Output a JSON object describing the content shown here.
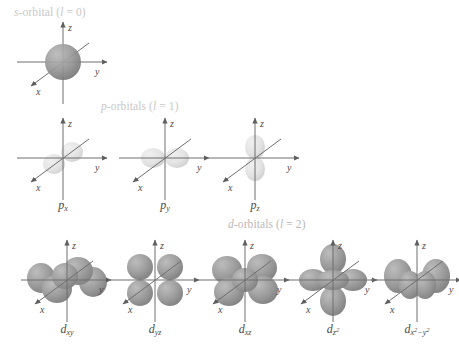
{
  "figure": {
    "background": "#ffffff",
    "axis_color": "#6e6e6e",
    "label_color": "#4a4a4a",
    "header_color": "#c8c8c8",
    "lobe_color": "#8c8c8c",
    "lobe_color_light": "#d8d8d8"
  },
  "sections": [
    {
      "id": "s",
      "header": "s-orbital (l = 0)",
      "header_prefix": "s",
      "header_rest": "-orbital (",
      "header_l": "l",
      "header_tail": " = 0)",
      "x": 14,
      "y": 6,
      "orbitals": [
        {
          "label": "",
          "label_base": "",
          "sub": "",
          "cx": 63,
          "cy": 62,
          "kind": "s"
        }
      ]
    },
    {
      "id": "p",
      "header": "p-orbitals (l = 1)",
      "header_prefix": "p",
      "header_rest": "-orbitals (",
      "header_l": "l",
      "header_tail": " = 1)",
      "x": 101,
      "y": 100,
      "orbitals": [
        {
          "label": "px",
          "label_base": "p",
          "sub": "x",
          "cx": 63,
          "cy": 158,
          "kind": "px"
        },
        {
          "label": "py",
          "label_base": "p",
          "sub": "y",
          "cx": 165,
          "cy": 158,
          "kind": "py"
        },
        {
          "label": "pz",
          "label_base": "p",
          "sub": "z",
          "cx": 255,
          "cy": 158,
          "kind": "pz"
        }
      ]
    },
    {
      "id": "d",
      "header": "d-orbitals (l = 2)",
      "header_prefix": "d",
      "header_rest": "-orbitals (",
      "header_l": "l",
      "header_tail": " = 2)",
      "x": 228,
      "y": 218,
      "orbitals": [
        {
          "label": "dxy",
          "label_base": "d",
          "sub": "xy",
          "cx": 67,
          "cy": 280,
          "kind": "dxy"
        },
        {
          "label": "dyz",
          "label_base": "d",
          "sub": "yz",
          "cx": 155,
          "cy": 280,
          "kind": "dyz"
        },
        {
          "label": "dxz",
          "label_base": "d",
          "sub": "xz",
          "cx": 245,
          "cy": 280,
          "kind": "dxz"
        },
        {
          "label": "dz2",
          "label_base": "d",
          "sub": "z",
          "sup": "2",
          "cx": 333,
          "cy": 280,
          "kind": "dz2"
        },
        {
          "label": "dx2-y2",
          "label_base": "d",
          "sub": "x",
          "sup": "2",
          "sub2": "−y",
          "sup2": "2",
          "cx": 417,
          "cy": 280,
          "kind": "dx2y2"
        }
      ]
    }
  ],
  "axes": {
    "z_label": "z",
    "y_label": "y",
    "x_label": "x"
  },
  "labels": {
    "s_orbital_caption": "",
    "p_x": "p",
    "p_y": "p",
    "p_z": "p",
    "d_xy": "d",
    "d_yz": "d",
    "d_xz": "d",
    "d_z2": "d",
    "d_x2y2": "d",
    "sub_px": "x",
    "sub_py": "y",
    "sub_pz": "z",
    "sub_dxy": "xy",
    "sub_dyz": "yz",
    "sub_dxz": "xz",
    "sub_dz2_base": "z",
    "sub_dz2_exp": "2",
    "sub_dx2y2_a": "x",
    "sub_dx2y2_a_exp": "2",
    "sub_dx2y2_b": "−y",
    "sub_dx2y2_b_exp": "2"
  }
}
